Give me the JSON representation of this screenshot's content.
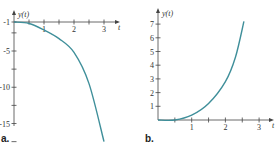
{
  "curve_color": "#3f8f9a",
  "axis_color": "#444444",
  "chart_data": [
    {
      "type": "line",
      "panel_label": "a.",
      "title": "",
      "xlabel": "t",
      "ylabel": "y(t)",
      "xlim": [
        0,
        3.2
      ],
      "ylim": [
        -18.5,
        -1
      ],
      "x_ticks": [
        1,
        2,
        3
      ],
      "x_minor_ticks": [
        0.5,
        1.5,
        2.5
      ],
      "y_ticks": [
        -1,
        -5,
        -10,
        -15
      ],
      "y_tick_labels": [
        "-1",
        "-5",
        "-10",
        "-15"
      ],
      "y_minor_ticks": [
        -2.5,
        -7.5,
        -12.5,
        -17.5
      ],
      "grid": false,
      "series": [
        {
          "name": "y(t)",
          "x": [
            0,
            0.5,
            1,
            1.5,
            2,
            2.5,
            3
          ],
          "y": [
            -1,
            -1.2,
            -2.1,
            -3.3,
            -5.2,
            -9.5,
            -17.5
          ]
        }
      ]
    },
    {
      "type": "line",
      "panel_label": "b.",
      "title": "",
      "xlabel": "t",
      "ylabel": "y(t)",
      "xlim": [
        0,
        3.2
      ],
      "ylim": [
        0,
        7.5
      ],
      "x_ticks": [
        1,
        2,
        3
      ],
      "x_minor_ticks": [
        0.5,
        1.5,
        2.5
      ],
      "y_ticks": [
        1,
        2,
        3,
        4,
        5,
        6,
        7
      ],
      "y_tick_labels": [
        "1",
        "2",
        "3",
        "4",
        "5",
        "6",
        "7"
      ],
      "grid": false,
      "series": [
        {
          "name": "y(t)",
          "x": [
            0,
            0.5,
            1,
            1.5,
            2,
            2.3,
            2.55
          ],
          "y": [
            0,
            0,
            0.35,
            1.2,
            2.8,
            4.6,
            7.2
          ]
        }
      ]
    }
  ]
}
